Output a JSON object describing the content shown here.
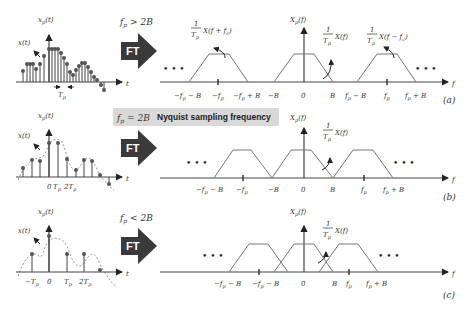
{
  "rows": [
    {
      "id": "a",
      "panel_label": "(a)",
      "condition": "f_p > 2B",
      "transform_label": "FT",
      "time_domain": {
        "signal_label": "x_p(t)",
        "continuous_label": "x(t)",
        "time_axis_label": "t",
        "period_label": "T_p"
      },
      "freq_domain": {
        "axis_label": "f",
        "spectrum_label": "X_p(f)",
        "ellipsis": "• • •",
        "replica_labels": [
          "1/T_p X(f + f_c)",
          "1/T_p X(f)",
          "1/T_p X(f − f_c)"
        ],
        "tick_labels": [
          "−f_p − B",
          "−f_p",
          "−f_p + B",
          "−B",
          "0",
          "B",
          "f_p − B",
          "f_p",
          "f_p + B"
        ]
      }
    },
    {
      "id": "b",
      "panel_label": "(b)",
      "condition": "f_p = 2B",
      "banner": "Nyquist sampling frequency",
      "transform_label": "FT",
      "time_domain": {
        "signal_label": "x_p(t)",
        "continuous_label": "x(t)",
        "time_axis_label": "t",
        "tick_labels": [
          "0",
          "T_p",
          "2T_p"
        ]
      },
      "freq_domain": {
        "axis_label": "f",
        "spectrum_label": "X_p(f)",
        "ellipsis": "• • •",
        "replica_labels": [
          "1/T_p X(f)"
        ],
        "tick_labels": [
          "−f_p − B",
          "−f_p",
          "−B",
          "0",
          "B",
          "f_p",
          "f_p + B"
        ]
      }
    },
    {
      "id": "c",
      "panel_label": "(c)",
      "condition": "f_p < 2B",
      "transform_label": "FT",
      "time_domain": {
        "signal_label": "x_p(t)",
        "continuous_label": "x(t)",
        "time_axis_label": "t",
        "tick_labels": [
          "−T_p",
          "0",
          "T_p",
          "2T_p"
        ]
      },
      "freq_domain": {
        "axis_label": "f",
        "spectrum_label": "X_p(f)",
        "ellipsis": "• • •",
        "replica_labels": [
          "1/T_p X(f)"
        ],
        "tick_labels": [
          "−f_p − B",
          "−f_p − B",
          "0",
          "B",
          "f_p",
          "f_p + B"
        ]
      }
    }
  ],
  "colors": {
    "arrow_fill": "#3a3a3a",
    "banner_bg": "#d9d9d9",
    "axis": "#444444",
    "trapezoid": "#777777"
  }
}
